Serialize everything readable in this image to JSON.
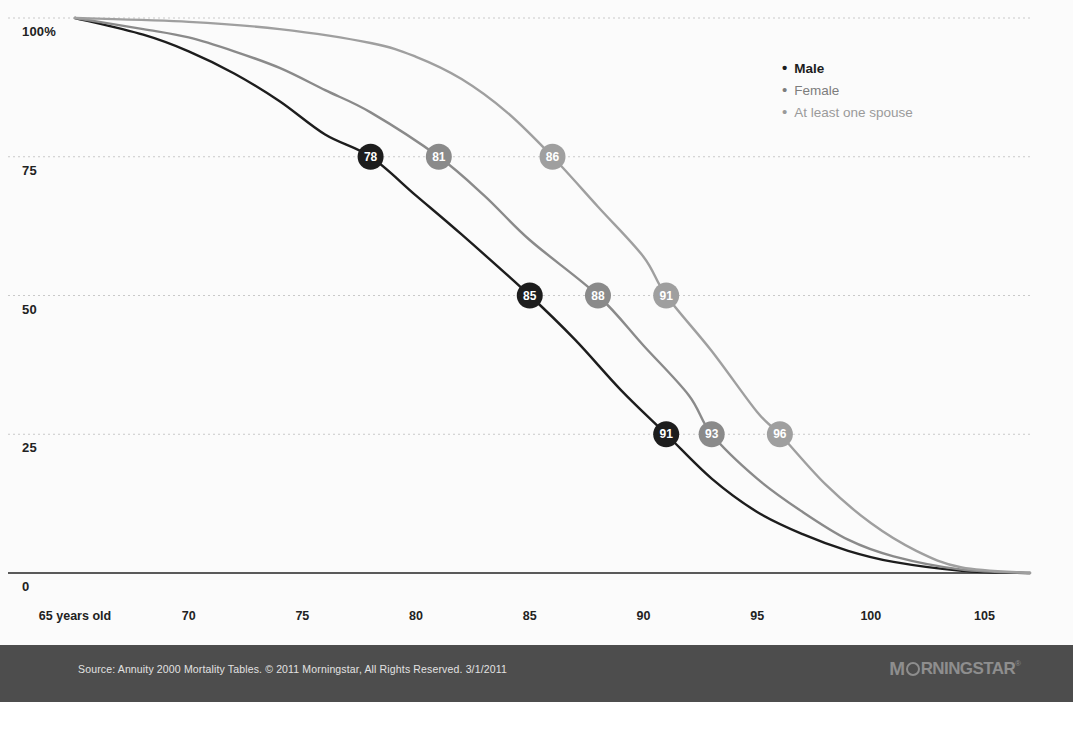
{
  "chart_data": {
    "type": "line",
    "title": "",
    "xlabel": "",
    "ylabel": "",
    "xlim": [
      65,
      107
    ],
    "ylim": [
      0,
      100
    ],
    "grid": true,
    "legend_position": "top-right",
    "x_ticks": [
      {
        "value": 65,
        "label": "65 years old"
      },
      {
        "value": 70,
        "label": "70"
      },
      {
        "value": 75,
        "label": "75"
      },
      {
        "value": 80,
        "label": "80"
      },
      {
        "value": 85,
        "label": "85"
      },
      {
        "value": 90,
        "label": "90"
      },
      {
        "value": 95,
        "label": "95"
      },
      {
        "value": 100,
        "label": "100"
      },
      {
        "value": 105,
        "label": "105"
      }
    ],
    "y_ticks": [
      {
        "value": 100,
        "label": "100%"
      },
      {
        "value": 75,
        "label": "75"
      },
      {
        "value": 50,
        "label": "50"
      },
      {
        "value": 25,
        "label": "25"
      },
      {
        "value": 0,
        "label": "0"
      }
    ],
    "series": [
      {
        "name": "Male",
        "color": "#1d1d1d",
        "points": [
          {
            "x": 65,
            "y": 100
          },
          {
            "x": 68,
            "y": 97
          },
          {
            "x": 70,
            "y": 94
          },
          {
            "x": 72,
            "y": 90
          },
          {
            "x": 74,
            "y": 85
          },
          {
            "x": 76,
            "y": 79
          },
          {
            "x": 78,
            "y": 75
          },
          {
            "x": 80,
            "y": 68
          },
          {
            "x": 82,
            "y": 61
          },
          {
            "x": 85,
            "y": 50
          },
          {
            "x": 87,
            "y": 42
          },
          {
            "x": 89,
            "y": 33
          },
          {
            "x": 91,
            "y": 25
          },
          {
            "x": 93,
            "y": 17
          },
          {
            "x": 95,
            "y": 11
          },
          {
            "x": 97,
            "y": 7
          },
          {
            "x": 99,
            "y": 4
          },
          {
            "x": 101,
            "y": 2
          },
          {
            "x": 104,
            "y": 0.4
          },
          {
            "x": 107,
            "y": 0
          }
        ],
        "markers": [
          {
            "x": 78,
            "y": 75,
            "label": "78"
          },
          {
            "x": 85,
            "y": 50,
            "label": "85"
          },
          {
            "x": 91,
            "y": 25,
            "label": "91"
          }
        ]
      },
      {
        "name": "Female",
        "color": "#8a8a8a",
        "points": [
          {
            "x": 65,
            "y": 100
          },
          {
            "x": 68,
            "y": 98
          },
          {
            "x": 70,
            "y": 96.5
          },
          {
            "x": 72,
            "y": 94
          },
          {
            "x": 74,
            "y": 91
          },
          {
            "x": 76,
            "y": 87
          },
          {
            "x": 78,
            "y": 83
          },
          {
            "x": 81,
            "y": 75
          },
          {
            "x": 83,
            "y": 68
          },
          {
            "x": 85,
            "y": 60
          },
          {
            "x": 88,
            "y": 50
          },
          {
            "x": 90,
            "y": 41
          },
          {
            "x": 92,
            "y": 32
          },
          {
            "x": 93,
            "y": 25
          },
          {
            "x": 95,
            "y": 17
          },
          {
            "x": 97,
            "y": 11
          },
          {
            "x": 99,
            "y": 6
          },
          {
            "x": 101,
            "y": 3
          },
          {
            "x": 104,
            "y": 0.6
          },
          {
            "x": 107,
            "y": 0
          }
        ],
        "markers": [
          {
            "x": 81,
            "y": 75,
            "label": "81"
          },
          {
            "x": 88,
            "y": 50,
            "label": "88"
          },
          {
            "x": 93,
            "y": 25,
            "label": "93"
          }
        ]
      },
      {
        "name": "At least one spouse",
        "color": "#9f9f9f",
        "points": [
          {
            "x": 65,
            "y": 100
          },
          {
            "x": 70,
            "y": 99.3
          },
          {
            "x": 74,
            "y": 98
          },
          {
            "x": 78,
            "y": 95.5
          },
          {
            "x": 80,
            "y": 93
          },
          {
            "x": 82,
            "y": 89
          },
          {
            "x": 84,
            "y": 83
          },
          {
            "x": 86,
            "y": 75
          },
          {
            "x": 88,
            "y": 66
          },
          {
            "x": 90,
            "y": 57
          },
          {
            "x": 91,
            "y": 50
          },
          {
            "x": 93,
            "y": 40
          },
          {
            "x": 95,
            "y": 29
          },
          {
            "x": 96,
            "y": 25
          },
          {
            "x": 98,
            "y": 16
          },
          {
            "x": 100,
            "y": 9
          },
          {
            "x": 102,
            "y": 4
          },
          {
            "x": 104,
            "y": 1
          },
          {
            "x": 107,
            "y": 0
          }
        ],
        "markers": [
          {
            "x": 86,
            "y": 75,
            "label": "86"
          },
          {
            "x": 91,
            "y": 50,
            "label": "91"
          },
          {
            "x": 96,
            "y": 25,
            "label": "96"
          }
        ]
      }
    ]
  },
  "legend": {
    "bullet": "•",
    "items": [
      {
        "label": "Male",
        "class": "male"
      },
      {
        "label": "Female",
        "class": "female"
      },
      {
        "label": "At least one spouse",
        "class": "spouse"
      }
    ]
  },
  "footer": {
    "source": "Source: Annuity 2000 Mortality Tables. © 2011 Morningstar, All Rights Reserved. 3/1/2011",
    "brand": {
      "prefix": "M",
      "word": "RNINGSTAR",
      "tm": "®"
    }
  },
  "colors": {
    "male": "#1d1d1d",
    "female": "#8a8a8a",
    "spouse": "#9f9f9f",
    "gridline": "#c9c9c9",
    "axis": "#5a5a5a",
    "footer_band": "#4d4d4d",
    "plot_bg": "#fbfbfb"
  }
}
